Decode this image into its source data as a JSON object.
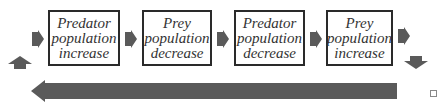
{
  "diagram": {
    "type": "cycle-flow",
    "boxes": [
      {
        "line1": "Predator",
        "line2": "population",
        "line3": "increase"
      },
      {
        "line1": "Prey",
        "line2": "population",
        "line3": "decrease"
      },
      {
        "line1": "Predator",
        "line2": "population",
        "line3": "decrease"
      },
      {
        "line1": "Prey",
        "line2": "population",
        "line3": "increase"
      }
    ],
    "arrow_color": "#5a5a5a",
    "box_border_color": "#2a2a2a",
    "text_color": "#333333"
  }
}
